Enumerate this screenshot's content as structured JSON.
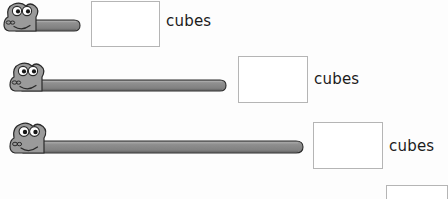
{
  "page": {
    "background_color": "#fdfdfd",
    "width": 448,
    "height": 199
  },
  "colors": {
    "worm_body": "#8d8d8d",
    "worm_body_highlight": "#a8a8a8",
    "worm_body_shadow": "#6e6e6e",
    "worm_outline": "#2a2a2a",
    "eye_white": "#ffffff",
    "eye_pupil": "#1a1a1a",
    "box_border": "#b5b5b5",
    "box_fill": "#ffffff",
    "text": "#1b1b1b"
  },
  "rows": [
    {
      "id": "row-1",
      "worm": {
        "name": "measuring-worm-1",
        "x": 2,
        "y": 4,
        "body_length": 52,
        "body_height": 11,
        "head_width": 30,
        "head_height": 26
      },
      "answer_box": {
        "name": "answer-box-1",
        "x": 91,
        "y": 1,
        "width": 69,
        "height": 46,
        "value": ""
      },
      "label": {
        "name": "unit-label-1",
        "text": "cubes",
        "x": 166,
        "y": 14
      }
    },
    {
      "id": "row-2",
      "worm": {
        "name": "measuring-worm-2",
        "x": 8,
        "y": 64,
        "body_length": 200,
        "body_height": 11,
        "head_width": 30,
        "head_height": 26
      },
      "answer_box": {
        "name": "answer-box-2",
        "x": 238,
        "y": 56,
        "width": 70,
        "height": 47,
        "value": ""
      },
      "label": {
        "name": "unit-label-2",
        "text": "cubes",
        "x": 314,
        "y": 72
      }
    },
    {
      "id": "row-3",
      "worm": {
        "name": "measuring-worm-3",
        "x": 8,
        "y": 124,
        "body_length": 276,
        "body_height": 12,
        "head_width": 32,
        "head_height": 28
      },
      "answer_box": {
        "name": "answer-box-3",
        "x": 313,
        "y": 122,
        "width": 70,
        "height": 47,
        "value": ""
      },
      "label": {
        "name": "unit-label-3",
        "text": "cubes",
        "x": 389,
        "y": 139
      }
    }
  ],
  "partial_box": {
    "name": "answer-box-4-partial",
    "x": 386,
    "y": 185,
    "width": 62,
    "height": 14,
    "value": ""
  }
}
